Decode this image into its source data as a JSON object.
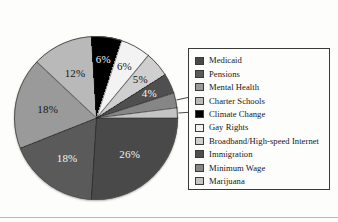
{
  "chart_data": {
    "type": "pie",
    "title": "",
    "subtitle": "",
    "xlabel": "",
    "ylabel": "",
    "legend_position": "right",
    "grid": false,
    "value_suffix": "%",
    "categories": [
      "Medicaid",
      "Pensions",
      "Mental Health",
      "Charter Schools",
      "Climate Change",
      "Gay Rights",
      "Broadband/High-speed Internet",
      "Immigration",
      "Minimum Wage",
      "Marijuana"
    ],
    "values": [
      26,
      18,
      18,
      12,
      6,
      6,
      5,
      4,
      3,
      2
    ],
    "labels": [
      "26%",
      "18%",
      "18%",
      "12%",
      "6%",
      "6%",
      "5%",
      "4%",
      "3%",
      "2%"
    ],
    "colors": [
      "#494949",
      "#5a5a5a",
      "#9a9a9a",
      "#b9b9b9",
      "#000000",
      "#f3f3f3",
      "#cfcfcf",
      "#4f4f4f",
      "#868686",
      "#c4c4c4"
    ],
    "label_text_colors": [
      "light",
      "light",
      "dark",
      "dark",
      "light",
      "dark",
      "dark",
      "light",
      "dark",
      "dark"
    ],
    "callout_slices": [
      "Minimum Wage",
      "Marijuana"
    ]
  },
  "legend": {
    "items": [
      {
        "label": "Medicaid",
        "color": "#494949"
      },
      {
        "label": "Pensions",
        "color": "#5a5a5a"
      },
      {
        "label": "Mental Health",
        "color": "#9a9a9a"
      },
      {
        "label": "Charter Schools",
        "color": "#b9b9b9"
      },
      {
        "label": "Climate Change",
        "color": "#000000"
      },
      {
        "label": "Gay Rights",
        "color": "#f3f3f3"
      },
      {
        "label": "Broadband/High-speed Internet",
        "color": "#cfcfcf"
      },
      {
        "label": "Immigration",
        "color": "#4f4f4f"
      },
      {
        "label": "Minimum Wage",
        "color": "#868686"
      },
      {
        "label": "Marijuana",
        "color": "#c4c4c4"
      }
    ]
  }
}
